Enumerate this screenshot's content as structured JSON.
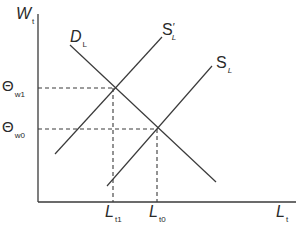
{
  "diagram": {
    "type": "supply-demand",
    "y_axis": {
      "main": "W",
      "sub": "t"
    },
    "x_axis": {
      "main": "L",
      "sub": "t"
    },
    "curves": {
      "demand": {
        "main": "D",
        "sub": "L"
      },
      "supply_shifted": {
        "main": "S",
        "prime": "′",
        "sub": "L"
      },
      "supply": {
        "main": "S",
        "sub": "L"
      }
    },
    "y_ticks": [
      {
        "main": "Θ",
        "sub": "w1"
      },
      {
        "main": "Θ",
        "sub": "w0"
      }
    ],
    "x_ticks": [
      {
        "main": "L",
        "sub": "t1"
      },
      {
        "main": "L",
        "sub": "t0"
      }
    ],
    "colors": {
      "line": "#3a3a3a",
      "text": "#2a2a2a"
    }
  }
}
